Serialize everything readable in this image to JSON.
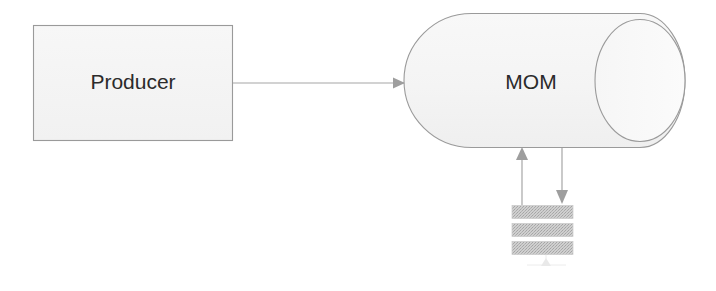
{
  "diagram": {
    "background_color": "#ffffff",
    "nodes": [
      {
        "id": "producer",
        "label": "Producer",
        "shape": "rectangle",
        "x": 33,
        "y": 25,
        "width": 199,
        "height": 115,
        "fill_color": "#f4f4f4",
        "stroke_color": "#9a9a9a",
        "text_color": "#2b2b2b"
      },
      {
        "id": "mom",
        "label": "MOM",
        "shape": "cylinder-horizontal",
        "x": 404,
        "y": 13,
        "width": 281,
        "height": 135,
        "fill_color": "#f6f6f6",
        "stroke_color": "#9a9a9a",
        "text_color": "#2b2b2b"
      },
      {
        "id": "consumer-rack",
        "label": "",
        "shape": "server-rack",
        "x": 512,
        "y": 205,
        "width": 61,
        "height": 50,
        "units": 3,
        "fill_color": "#c4c4c4",
        "stroke_color": "#c9c9c9"
      }
    ],
    "edges": [
      {
        "id": "producer-to-mom",
        "from": "producer",
        "to": "mom",
        "direction": "right",
        "label": "",
        "stroke_color": "#a6a6a6"
      },
      {
        "id": "rack-to-mom",
        "from": "consumer-rack",
        "to": "mom",
        "direction": "up",
        "label": "",
        "stroke_color": "#a6a6a6"
      },
      {
        "id": "mom-to-rack",
        "from": "mom",
        "to": "consumer-rack",
        "direction": "down",
        "label": "",
        "stroke_color": "#a6a6a6"
      }
    ]
  }
}
